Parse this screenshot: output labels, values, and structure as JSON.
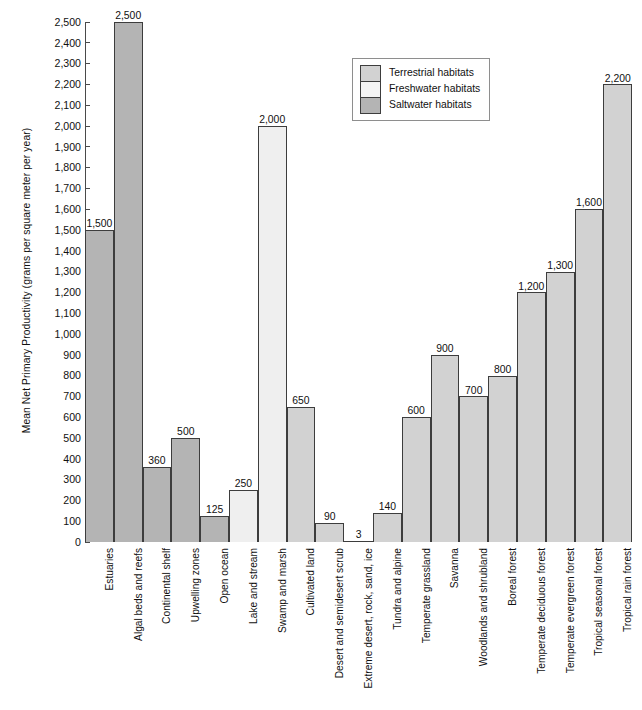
{
  "chart_data": {
    "type": "bar",
    "title": "",
    "xlabel": "",
    "ylabel": "Mean Net Primary Productivity (grams per square meter per year)",
    "ylim": [
      0,
      2500
    ],
    "ytick_step": 100,
    "grid": false,
    "legend_position": "top-right",
    "categories": [
      "Estuaries",
      "Algal beds and reefs",
      "Continental shelf",
      "Upwelling zones",
      "Open ocean",
      "Lake and stream",
      "Swamp and marsh",
      "Cultivated land",
      "Desert and semidesert scrub",
      "Extreme desert, rock, sand, ice",
      "Tundra and alpine",
      "Temperate grassland",
      "Savanna",
      "Woodlands and shrubland",
      "Boreal forest",
      "Temperate deciduous forest",
      "Temperate evergreen forest",
      "Tropical seasonal forest",
      "Tropical rain forest"
    ],
    "values": [
      1500,
      2500,
      360,
      500,
      125,
      250,
      2000,
      650,
      90,
      3,
      140,
      600,
      900,
      700,
      800,
      1200,
      1300,
      1600,
      2200
    ],
    "value_labels": [
      "1,500",
      "2,500",
      "360",
      "500",
      "125",
      "250",
      "2,000",
      "650",
      "90",
      "3",
      "140",
      "600",
      "900",
      "700",
      "800",
      "1,200",
      "1,300",
      "1,600",
      "2,200"
    ],
    "groups": [
      "saltwater",
      "saltwater",
      "saltwater",
      "saltwater",
      "saltwater",
      "freshwater",
      "freshwater",
      "terrestrial",
      "terrestrial",
      "terrestrial",
      "terrestrial",
      "terrestrial",
      "terrestrial",
      "terrestrial",
      "terrestrial",
      "terrestrial",
      "terrestrial",
      "terrestrial",
      "terrestrial"
    ],
    "ytick_labels": [
      "0",
      "100",
      "200",
      "300",
      "400",
      "500",
      "600",
      "700",
      "800",
      "900",
      "1,000",
      "1,100",
      "1,200",
      "1,300",
      "1,400",
      "1,500",
      "1,600",
      "1,700",
      "1,800",
      "1,900",
      "2,000",
      "2,100",
      "2,200",
      "2,300",
      "2,400",
      "2,500"
    ],
    "ytick_values": [
      0,
      100,
      200,
      300,
      400,
      500,
      600,
      700,
      800,
      900,
      1000,
      1100,
      1200,
      1300,
      1400,
      1500,
      1600,
      1700,
      1800,
      1900,
      2000,
      2100,
      2200,
      2300,
      2400,
      2500
    ],
    "legend": [
      {
        "label": "Terrestrial habitats",
        "key": "terrestrial",
        "color": "#d2d2d2"
      },
      {
        "label": "Freshwater habitats",
        "key": "freshwater",
        "color": "#f4f4f4"
      },
      {
        "label": "Saltwater habitats",
        "key": "saltwater",
        "color": "#b4b4b4"
      }
    ]
  }
}
